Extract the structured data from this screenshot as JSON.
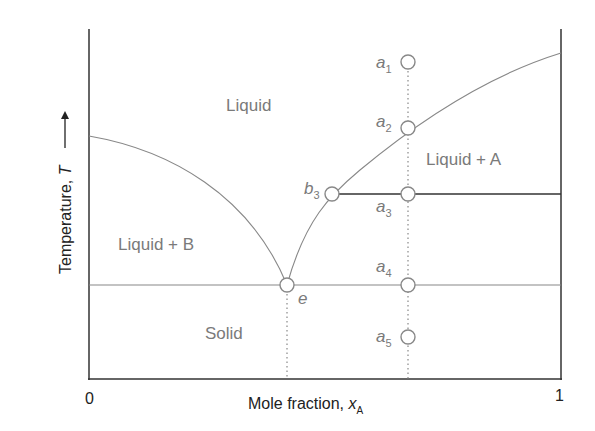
{
  "diagram": {
    "type": "phase-diagram",
    "title": "",
    "axes": {
      "x_label": "Mole fraction, ",
      "x_var": "x",
      "x_sub": "A",
      "y_label": "Temperature, ",
      "y_var": "T",
      "x_ticks": [
        "0",
        "1"
      ]
    },
    "regions": {
      "liquid": "Liquid",
      "liquid_a": "Liquid + A",
      "liquid_b": "Liquid + B",
      "solid": "Solid"
    },
    "points": [
      {
        "label": "a",
        "sub": "1"
      },
      {
        "label": "a",
        "sub": "2"
      },
      {
        "label": "a",
        "sub": "3"
      },
      {
        "label": "a",
        "sub": "4"
      },
      {
        "label": "a",
        "sub": "5"
      },
      {
        "label": "b",
        "sub": "3"
      },
      {
        "label": "e",
        "sub": ""
      }
    ],
    "colors": {
      "axis": "#333333",
      "curve": "#888888",
      "text": "#7a7a7a",
      "tie_line": "#333333"
    }
  }
}
